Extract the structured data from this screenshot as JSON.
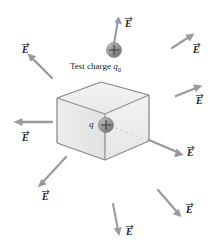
{
  "figure": {
    "title_text_faint": "",
    "box": {
      "name": "gaussian-surface-box",
      "face_fill": "#f0f0f0",
      "edge_color": "#8c8c8c",
      "hidden_edge_color": "#b0b0b0"
    },
    "charges": [
      {
        "name": "enclosed-charge",
        "label": "q",
        "sign": "+",
        "sphere_color": "#8a8a8a"
      },
      {
        "name": "test-charge",
        "label_prefix": "Test charge ",
        "label_symbol": "q",
        "label_subscript": "0",
        "sign": "+",
        "sphere_color": "#8a8a8a"
      }
    ],
    "field_vectors": [
      {
        "name": "field-vector-test-charge",
        "label": "E",
        "direction": "up"
      },
      {
        "name": "field-vector-upper-left",
        "label": "E",
        "direction": "up-left"
      },
      {
        "name": "field-vector-left",
        "label": "E",
        "direction": "left"
      },
      {
        "name": "field-vector-lower-left",
        "label": "E",
        "direction": "down-left"
      },
      {
        "name": "field-vector-bottom",
        "label": "E",
        "direction": "down"
      },
      {
        "name": "field-vector-lower-right",
        "label": "E",
        "direction": "down-right"
      },
      {
        "name": "field-vector-right",
        "label": "E",
        "direction": "down-right"
      },
      {
        "name": "field-vector-middle-right",
        "label": "E",
        "direction": "up-right"
      },
      {
        "name": "field-vector-upper-right",
        "label": "E",
        "direction": "up-right"
      }
    ],
    "colors": {
      "arrow": "#9a9a9a",
      "arrow_dark": "#7d7d7d",
      "text": "#1a1a1a",
      "background": "#ffffff"
    }
  }
}
